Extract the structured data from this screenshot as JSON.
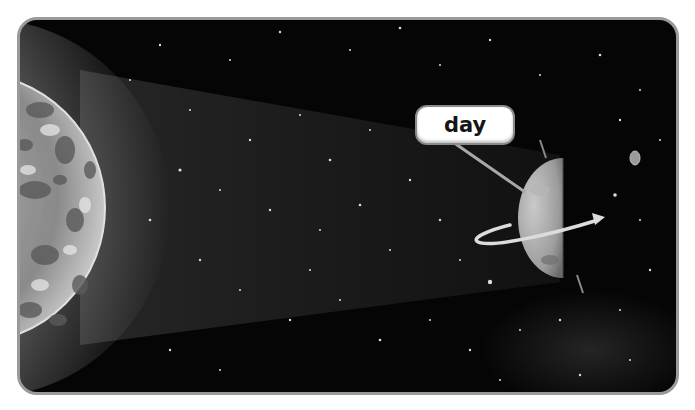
{
  "figure": {
    "label": "day",
    "objects": {
      "sun": "sun",
      "planet": "planet",
      "moon": "moon",
      "light_beam": "sunlight beam",
      "rotation_arrow": "rotation arrow",
      "axis": "planet axis"
    },
    "colors": {
      "frame_border": "#9a9a9a",
      "space": "#050505",
      "label_bg": "#ffffff",
      "label_text": "#151515"
    }
  }
}
